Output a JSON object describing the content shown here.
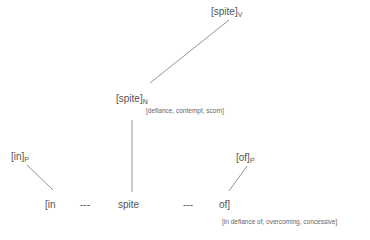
{
  "diagram": {
    "nodes": {
      "spite_v": {
        "text": "[spite]",
        "sub": "V"
      },
      "spite_n": {
        "text": "[spite]",
        "sub": "N",
        "gloss": "[defiance, contempt, scorn]"
      },
      "in_p": {
        "text": "[in]",
        "sub": "P"
      },
      "of_p": {
        "text": "[of]",
        "sub": "P"
      }
    },
    "surface": {
      "w1": "[in",
      "dash1": "---",
      "w2": "spite",
      "dash2": "---",
      "w3": "of]",
      "gloss": "[in defiance of, overcoming, concessive]"
    },
    "edges": [
      {
        "from": "spite_v",
        "to": "spite_n"
      },
      {
        "from": "spite_n",
        "to": "spite"
      },
      {
        "from": "in_p",
        "to": "[in"
      },
      {
        "from": "of_p",
        "to": "of]"
      }
    ],
    "colors": {
      "text": "#555555",
      "line": "#888888"
    }
  }
}
